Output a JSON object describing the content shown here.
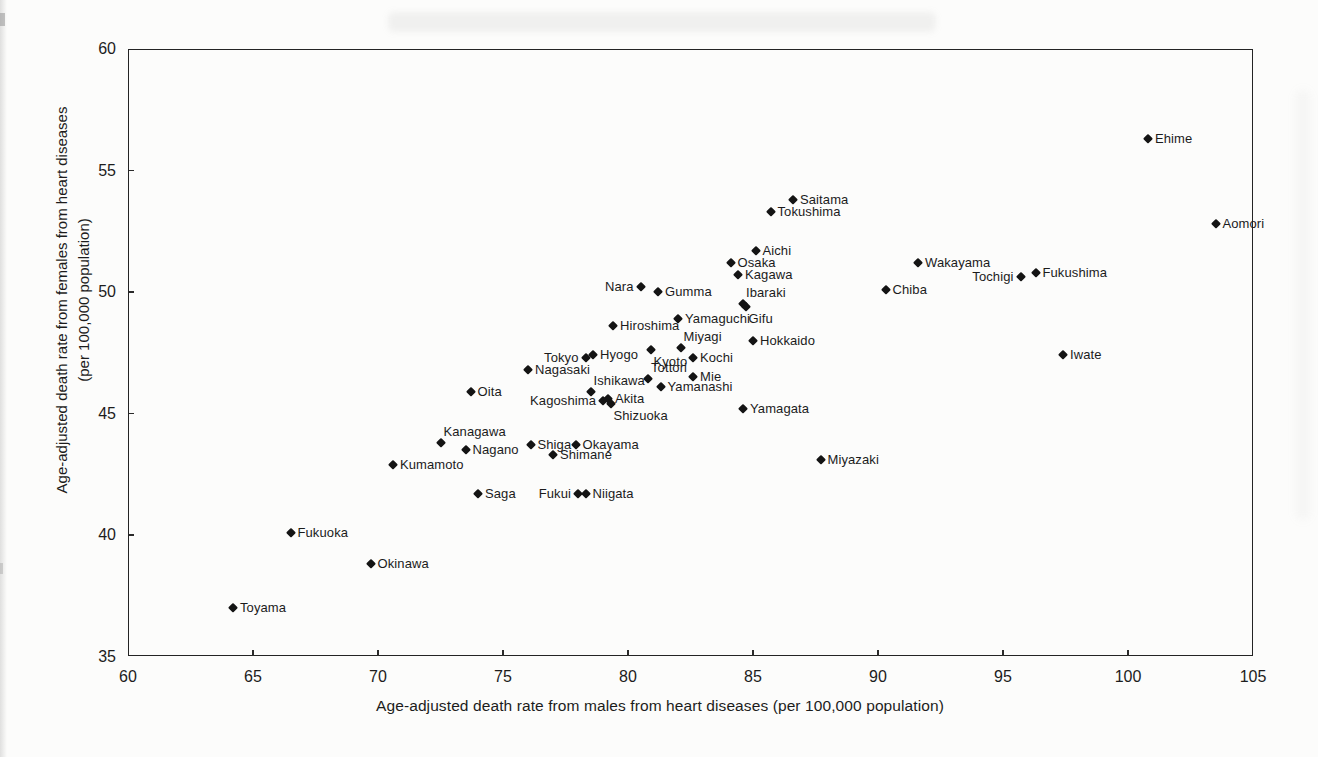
{
  "chart_data": {
    "type": "scatter",
    "title": "",
    "xlabel": "Age-adjusted death rate from males from heart diseases (per 100,000 population)",
    "ylabel_line1": "Age-adjusted death rate from females from heart diseases",
    "ylabel_line2": "(per 100,000 population)",
    "xlim": [
      60,
      105
    ],
    "ylim": [
      35,
      60
    ],
    "x_ticks": [
      60,
      65,
      70,
      75,
      80,
      85,
      90,
      95,
      100,
      105
    ],
    "y_ticks": [
      60,
      55,
      50,
      45,
      40,
      35
    ],
    "grid": false,
    "legend": "none",
    "marker": "diamond",
    "marker_color": "#141414",
    "points": [
      {
        "name": "Toyama",
        "x": 64.2,
        "y": 37.0,
        "label": "right"
      },
      {
        "name": "Fukuoka",
        "x": 66.5,
        "y": 40.1,
        "label": "right"
      },
      {
        "name": "Okinawa",
        "x": 69.7,
        "y": 38.8,
        "label": "right"
      },
      {
        "name": "Kumamoto",
        "x": 70.6,
        "y": 42.9,
        "label": "right"
      },
      {
        "name": "Kanagawa",
        "x": 72.5,
        "y": 43.8,
        "label": "above-right"
      },
      {
        "name": "Nagano",
        "x": 73.5,
        "y": 43.5,
        "label": "right"
      },
      {
        "name": "Oita",
        "x": 73.7,
        "y": 45.9,
        "label": "right"
      },
      {
        "name": "Saga",
        "x": 74.0,
        "y": 41.7,
        "label": "right"
      },
      {
        "name": "Nagasaki",
        "x": 76.0,
        "y": 46.8,
        "label": "right"
      },
      {
        "name": "Shiga",
        "x": 76.1,
        "y": 43.7,
        "label": "right"
      },
      {
        "name": "Shimane",
        "x": 77.0,
        "y": 43.3,
        "label": "right"
      },
      {
        "name": "Okayama",
        "x": 77.9,
        "y": 43.7,
        "label": "right"
      },
      {
        "name": "Fukui",
        "x": 78.0,
        "y": 41.7,
        "label": "left"
      },
      {
        "name": "Tokyo",
        "x": 78.3,
        "y": 47.3,
        "label": "left"
      },
      {
        "name": "Niigata",
        "x": 78.3,
        "y": 41.7,
        "label": "right"
      },
      {
        "name": "Ishikawa",
        "x": 78.5,
        "y": 45.9,
        "label": "above-right"
      },
      {
        "name": "Hyogo",
        "x": 78.6,
        "y": 47.4,
        "label": "right"
      },
      {
        "name": "Kagoshima",
        "x": 79.0,
        "y": 45.5,
        "label": "left"
      },
      {
        "name": "Akita",
        "x": 79.2,
        "y": 45.6,
        "label": "right"
      },
      {
        "name": "Shizuoka",
        "x": 79.3,
        "y": 45.4,
        "label": "below-right"
      },
      {
        "name": "Hiroshima",
        "x": 79.4,
        "y": 48.6,
        "label": "right"
      },
      {
        "name": "Nara",
        "x": 80.5,
        "y": 50.2,
        "label": "left"
      },
      {
        "name": "Tottori",
        "x": 80.8,
        "y": 46.4,
        "label": "above-right"
      },
      {
        "name": "Kyoto",
        "x": 80.9,
        "y": 47.6,
        "label": "below-right"
      },
      {
        "name": "Gumma",
        "x": 81.2,
        "y": 50.0,
        "label": "right"
      },
      {
        "name": "Yamanashi",
        "x": 81.3,
        "y": 46.1,
        "label": "right"
      },
      {
        "name": "Yamaguchi",
        "x": 82.0,
        "y": 48.9,
        "label": "right"
      },
      {
        "name": "Miyagi",
        "x": 82.1,
        "y": 47.7,
        "label": "above-right"
      },
      {
        "name": "Kochi",
        "x": 82.6,
        "y": 47.3,
        "label": "right"
      },
      {
        "name": "Mie",
        "x": 82.6,
        "y": 46.5,
        "label": "right"
      },
      {
        "name": "Osaka",
        "x": 84.1,
        "y": 51.2,
        "label": "right"
      },
      {
        "name": "Kagawa",
        "x": 84.4,
        "y": 50.7,
        "label": "right"
      },
      {
        "name": "Ibaraki",
        "x": 84.6,
        "y": 49.5,
        "label": "above-right"
      },
      {
        "name": "Gifu",
        "x": 84.7,
        "y": 49.4,
        "label": "below-right"
      },
      {
        "name": "Yamagata",
        "x": 84.6,
        "y": 45.2,
        "label": "right"
      },
      {
        "name": "Hokkaido",
        "x": 85.0,
        "y": 48.0,
        "label": "right"
      },
      {
        "name": "Aichi",
        "x": 85.1,
        "y": 51.7,
        "label": "right"
      },
      {
        "name": "Tokushima",
        "x": 85.7,
        "y": 53.3,
        "label": "right"
      },
      {
        "name": "Saitama",
        "x": 86.6,
        "y": 53.8,
        "label": "right"
      },
      {
        "name": "Miyazaki",
        "x": 87.7,
        "y": 43.1,
        "label": "right"
      },
      {
        "name": "Chiba",
        "x": 90.3,
        "y": 50.1,
        "label": "right"
      },
      {
        "name": "Wakayama",
        "x": 91.6,
        "y": 51.2,
        "label": "right"
      },
      {
        "name": "Tochigi",
        "x": 95.7,
        "y": 50.6,
        "label": "left"
      },
      {
        "name": "Fukushima",
        "x": 96.3,
        "y": 50.8,
        "label": "right"
      },
      {
        "name": "Iwate",
        "x": 97.4,
        "y": 47.4,
        "label": "right"
      },
      {
        "name": "Ehime",
        "x": 100.8,
        "y": 56.3,
        "label": "right"
      },
      {
        "name": "Aomori",
        "x": 103.5,
        "y": 52.8,
        "label": "right"
      }
    ]
  }
}
